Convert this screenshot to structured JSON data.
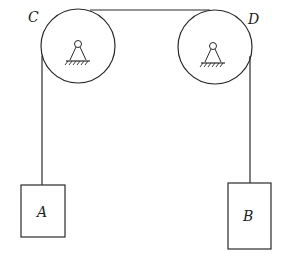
{
  "diagram": {
    "type": "pulley-system",
    "pulleys": [
      {
        "label": "C",
        "cx": 78,
        "cy": 46,
        "r": 37
      },
      {
        "label": "D",
        "cx": 215,
        "cy": 47,
        "r": 37
      }
    ],
    "blocks": [
      {
        "label": "A",
        "x": 21,
        "y": 185,
        "w": 44,
        "h": 52
      },
      {
        "label": "B",
        "x": 228,
        "y": 183,
        "w": 43,
        "h": 66
      }
    ],
    "colors": {
      "stroke": "#2a2a2a",
      "background": "#ffffff"
    }
  }
}
